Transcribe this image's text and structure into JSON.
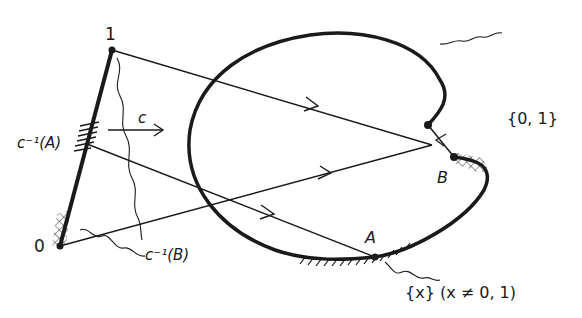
{
  "figure": {
    "type": "topology-diagram",
    "background": "#ffffff",
    "ink": "#1a1a1a"
  },
  "labels": {
    "point_one": "1",
    "point_zero": "0",
    "map_c": "c",
    "preimage_A": "c⁻¹(A)",
    "preimage_B": "c⁻¹(B)",
    "point_A": "A",
    "point_B": "B",
    "set_0_1": "{0, 1}",
    "set_x": "{x} (x ≠ 0, 1)"
  }
}
